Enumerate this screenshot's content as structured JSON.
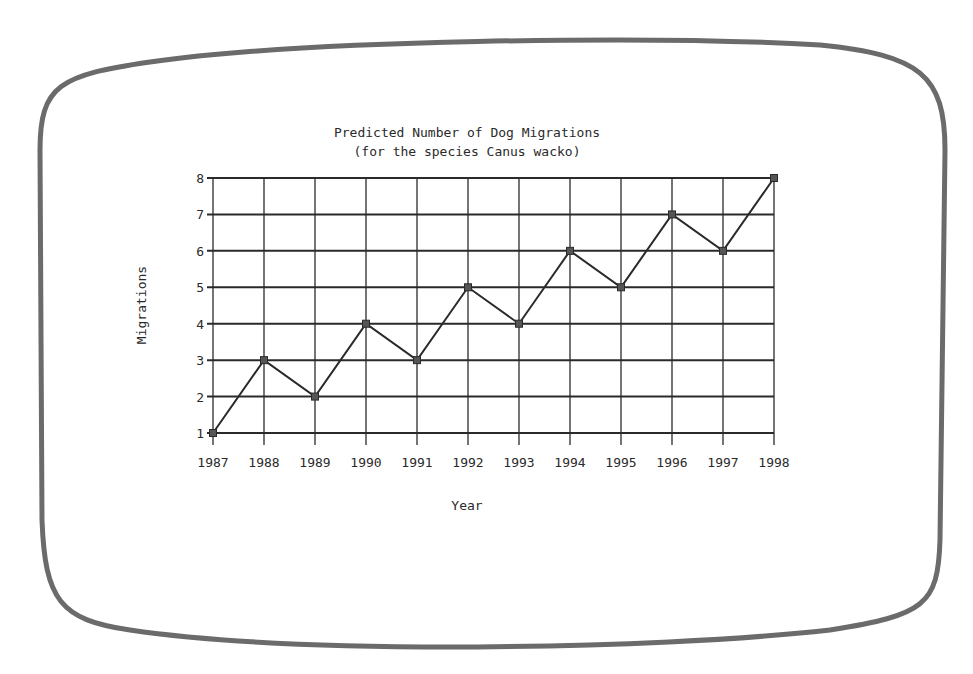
{
  "screen": {
    "bezel_color": "#6b6b6b",
    "background": "#ffffff"
  },
  "chart_data": {
    "type": "line",
    "title": "Predicted Number of Dog Migrations",
    "subtitle": "(for the species Canus wacko)",
    "xlabel": "Year",
    "ylabel": "Migrations",
    "categories": [
      "1987",
      "1988",
      "1989",
      "1990",
      "1991",
      "1992",
      "1993",
      "1994",
      "1995",
      "1996",
      "1997",
      "1998"
    ],
    "x_tick_labels": [
      "1987",
      "1988",
      "1989",
      "1990",
      "1991",
      "1992",
      "1993",
      "1994",
      "1995",
      "1996",
      "1997",
      "1998"
    ],
    "y_tick_labels": [
      "1",
      "2",
      "3",
      "4",
      "5",
      "6",
      "7",
      "8"
    ],
    "series": [
      {
        "name": "Migrations",
        "values": [
          1,
          3,
          2,
          4,
          3,
          5,
          4,
          6,
          5,
          7,
          6,
          8
        ],
        "marker": "square",
        "color": "#2a2a2a"
      }
    ],
    "ylim": [
      1,
      8
    ],
    "grid": true,
    "legend": "none"
  }
}
